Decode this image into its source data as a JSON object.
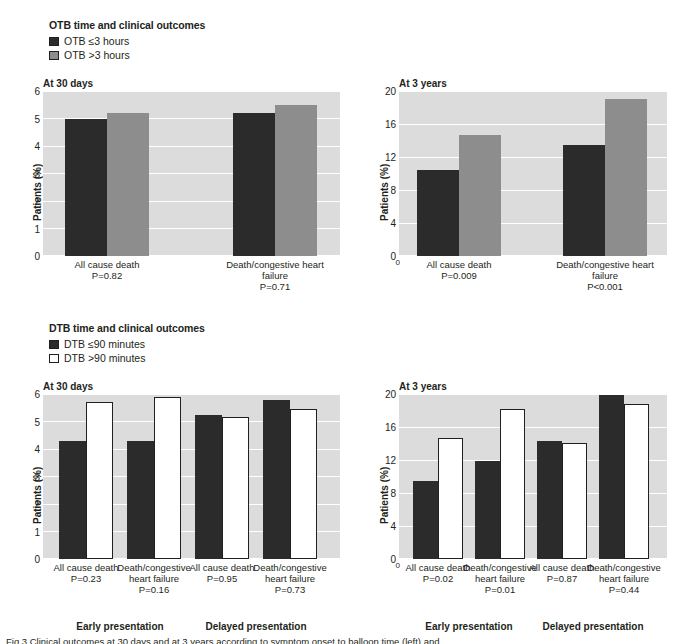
{
  "figure": {
    "caption_fragment": "Fig 3 Clinical outcomes at 30 days and at 3 years according to symptom onset to balloon time (left) and"
  },
  "sections": [
    {
      "id": "otb",
      "title": "OTB time and clinical outcomes",
      "legend": [
        {
          "label": "OTB ≤3 hours",
          "color": "#2b2b2b",
          "style": "filled"
        },
        {
          "label": "OTB >3 hours",
          "color": "#8d8d8d",
          "style": "filled"
        }
      ]
    },
    {
      "id": "dtb",
      "title": "DTB time and clinical outcomes",
      "legend": [
        {
          "label": "DTB ≤90 minutes",
          "color": "#2b2b2b",
          "style": "filled"
        },
        {
          "label": "DTB >90 minutes",
          "color": "#ffffff",
          "style": "outlined"
        }
      ]
    }
  ],
  "chart_data": [
    {
      "id": "otb-30-days",
      "type": "bar",
      "title": "At 30 days",
      "ylabel": "Patients (%)",
      "xlabel": "",
      "ylim": [
        0,
        6
      ],
      "yticks": [
        0,
        1,
        2,
        3,
        4,
        5,
        6
      ],
      "ytick_labels": [
        "0",
        "1",
        "2",
        "3",
        "4",
        "5",
        "6"
      ],
      "grid": true,
      "legend_position": "above-left",
      "categories": [
        "All cause death",
        "Death/congestive heart failure"
      ],
      "category_annotations": [
        "P=0.82",
        "P=0.71"
      ],
      "series": [
        {
          "name": "OTB ≤3 hours",
          "color": "#2b2b2b",
          "values": [
            5.0,
            5.2
          ]
        },
        {
          "name": "OTB >3 hours",
          "color": "#8d8d8d",
          "values": [
            5.2,
            5.5
          ]
        }
      ],
      "group_labels": []
    },
    {
      "id": "otb-3-years",
      "type": "bar",
      "title": "At 3 years",
      "ylabel": "Patients (%)",
      "xlabel": "",
      "ylim": [
        0,
        20
      ],
      "yticks": [
        0,
        4,
        8,
        12,
        16,
        20
      ],
      "ytick_labels": [
        "0",
        "4",
        "8",
        "12",
        "16",
        "20"
      ],
      "grid": true,
      "legend_position": "above-left",
      "categories": [
        "All cause death",
        "Death/congestive heart failure"
      ],
      "category_annotations": [
        "P=0.009",
        "P<0.001"
      ],
      "series": [
        {
          "name": "OTB ≤3 hours",
          "color": "#2b2b2b",
          "values": [
            10.4,
            13.5
          ]
        },
        {
          "name": "OTB >3 hours",
          "color": "#8d8d8d",
          "values": [
            14.7,
            19.0
          ]
        }
      ],
      "group_labels": []
    },
    {
      "id": "dtb-30-days",
      "type": "bar",
      "title": "At 30 days",
      "ylabel": "Patients (%)",
      "xlabel": "",
      "ylim": [
        0,
        6
      ],
      "yticks": [
        0,
        1,
        2,
        3,
        4,
        5,
        6
      ],
      "ytick_labels": [
        "0",
        "1",
        "2",
        "3",
        "4",
        "5",
        "6"
      ],
      "grid": true,
      "legend_position": "above-left",
      "categories": [
        "All cause death",
        "Death/congestive heart failure",
        "All cause death",
        "Death/congestive heart failure"
      ],
      "category_annotations": [
        "P=0.23",
        "P=0.16",
        "P=0.95",
        "P=0.73"
      ],
      "series": [
        {
          "name": "DTB ≤90 minutes",
          "color": "#2b2b2b",
          "values": [
            4.3,
            4.3,
            5.25,
            5.8
          ]
        },
        {
          "name": "DTB >90 minutes",
          "color": "#ffffff",
          "values": [
            5.7,
            5.9,
            5.15,
            5.45
          ]
        }
      ],
      "group_labels": [
        "Early presentation",
        "Delayed presentation"
      ]
    },
    {
      "id": "dtb-3-years",
      "type": "bar",
      "title": "At 3 years",
      "ylabel": "Patients (%)",
      "xlabel": "",
      "ylim": [
        0,
        20
      ],
      "yticks": [
        0,
        4,
        8,
        12,
        16,
        20
      ],
      "ytick_labels": [
        "0",
        "4",
        "8",
        "12",
        "16",
        "20"
      ],
      "grid": true,
      "legend_position": "above-left",
      "categories": [
        "All cause death",
        "Death/congestive heart failure",
        "All cause death",
        "Death/congestive heart failure"
      ],
      "category_annotations": [
        "P=0.02",
        "P=0.01",
        "P=0.87",
        "P=0.44"
      ],
      "series": [
        {
          "name": "DTB ≤90 minutes",
          "color": "#2b2b2b",
          "values": [
            9.5,
            11.9,
            14.3,
            19.9
          ]
        },
        {
          "name": "DTB >90 minutes",
          "color": "#ffffff",
          "values": [
            14.7,
            18.2,
            14.1,
            18.8
          ]
        }
      ],
      "group_labels": [
        "Early presentation",
        "Delayed presentation"
      ]
    }
  ]
}
